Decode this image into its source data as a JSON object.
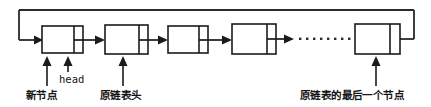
{
  "diagram": {
    "colors": {
      "stroke": "#1b1b1b",
      "background": "#ffffff",
      "dot": "#2b2b2b"
    },
    "nodes": [
      {
        "id": "new-node",
        "role": "new node inserted at head",
        "x": 42,
        "y": 26,
        "width": 41,
        "height": 27,
        "divider_offset": 32
      },
      {
        "id": "node-2",
        "role": "original list head",
        "x": 105,
        "y": 25,
        "width": 43,
        "height": 29,
        "divider_offset": 34
      },
      {
        "id": "node-3",
        "role": "interior node",
        "x": 168,
        "y": 26,
        "width": 40,
        "height": 27,
        "divider_offset": 31
      },
      {
        "id": "node-4",
        "role": "interior node",
        "x": 232,
        "y": 24,
        "width": 44,
        "height": 30,
        "divider_offset": 35
      },
      {
        "id": "node-last",
        "role": "last node of original list",
        "x": 355,
        "y": 24,
        "width": 45,
        "height": 30,
        "divider_offset": 35
      }
    ],
    "ellipsis": {
      "dot_count": 9,
      "x_start": 296,
      "x_end": 350,
      "y": 39
    },
    "loop": {
      "description": "pointer of last node loops back to the new head node",
      "top_y": 10,
      "left_x": 19,
      "right_x": 414
    },
    "labels": {
      "new_node": "新节点",
      "head": "head",
      "original_head": "原链表头",
      "last_node": "原链表的最后一个节点"
    }
  }
}
